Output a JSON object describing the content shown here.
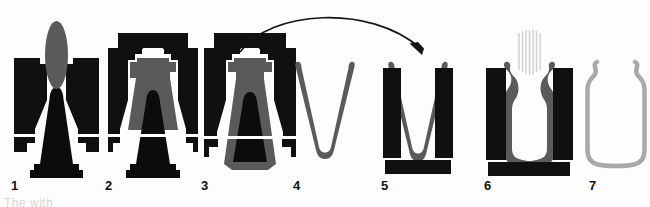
{
  "figure": {
    "background": "#fdfdfd",
    "clipped_caption": "The                 with"
  },
  "palette": {
    "mold_black": "#101010",
    "polymer_gray": "#5a5a5a",
    "polymer_gray_dark": "#4e4e4e",
    "bottle_outline_gray": "#a9a9a9",
    "air_stream_gray": "#cfcfcf",
    "arrow_black": "#141414",
    "parting_line": "#ffffff",
    "label_color": "#111111"
  },
  "transfer_arrow": {
    "name": "transfer-arrow",
    "from_stage": "3",
    "to_stage": "5",
    "description": "curved arrow from preform mould to blow mould"
  },
  "air_stream": {
    "name": "blow-air-stream",
    "stage": "6",
    "line_count": 7,
    "description": "compressed air injected through neck"
  },
  "stages": [
    {
      "number": "1",
      "label": "1",
      "name": "stage-1-injection-open-mould",
      "description": "Open mould halves with core pin and molten parison",
      "elements": [
        "mold-half-left",
        "mold-half-right",
        "core-pin",
        "parison-blob"
      ]
    },
    {
      "number": "2",
      "label": "2",
      "name": "stage-2-mould-closed-injection",
      "description": "Mould closed, polymer injected around core pin",
      "elements": [
        "top-plate",
        "mold-half-left",
        "mold-half-right",
        "core-pin",
        "polymer-melt"
      ]
    },
    {
      "number": "3",
      "label": "3",
      "name": "stage-3-preform-formed",
      "description": "Thin-walled preform formed in injection mould",
      "elements": [
        "top-plate",
        "mold-half-left",
        "mold-half-right",
        "core-pin",
        "preform-wall"
      ]
    },
    {
      "number": "4",
      "label": "4",
      "name": "stage-4-preform-ejected",
      "description": "Preform removed from mould, free standing",
      "elements": [
        "preform"
      ]
    },
    {
      "number": "5",
      "label": "5",
      "name": "stage-5-preform-in-blow-mould",
      "description": "Preform transferred and placed into blow mould",
      "elements": [
        "mold-half-left",
        "mold-half-right",
        "base-plate",
        "preform"
      ]
    },
    {
      "number": "6",
      "label": "6",
      "name": "stage-6-blowing",
      "description": "Compressed air blows preform against mould walls",
      "elements": [
        "mold-half-left",
        "mold-half-right",
        "base-plate",
        "bottle-wall",
        "air-stream"
      ]
    },
    {
      "number": "7",
      "label": "7",
      "name": "stage-7-finished-bottle",
      "description": "Finished blown bottle after mould removal",
      "elements": [
        "bottle-outline"
      ]
    }
  ]
}
